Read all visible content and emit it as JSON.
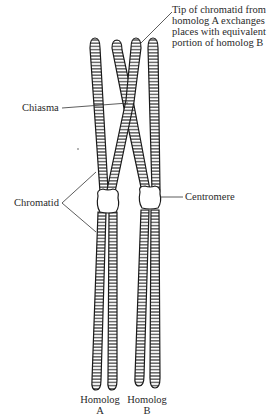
{
  "diagram": {
    "type": "chromosome-crossing-over",
    "labels": {
      "tip_note": [
        "Tip of chromatid from",
        "homolog A exchanges",
        "places with equivalent",
        "portion of homolog B"
      ],
      "chiasma": "Chiasma",
      "chromatid": "Chromatid",
      "centromere": "Centromere",
      "homolog_a": [
        "Homolog",
        "A"
      ],
      "homolog_b": [
        "Homolog",
        "B"
      ]
    },
    "colors": {
      "outline": "#1a1a1a",
      "band": "#2a2a2a",
      "fill": "#ffffff"
    }
  }
}
